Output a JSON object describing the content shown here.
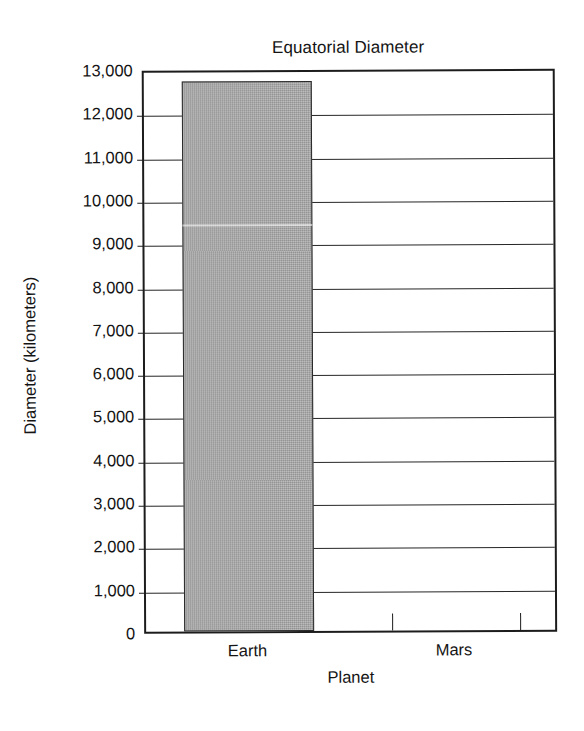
{
  "chart_data": {
    "type": "bar",
    "title": "Equatorial Diameter",
    "xlabel": "Planet",
    "ylabel": "Diameter (kilometers)",
    "categories": [
      "Earth",
      "Mars"
    ],
    "values": [
      12800,
      null
    ],
    "ylim": [
      0,
      13000
    ],
    "ytick_step": 1000,
    "yticks": [
      "13,000",
      "12,000",
      "11,000",
      "10,000",
      "9,000",
      "8,000",
      "7,000",
      "6,000",
      "5,000",
      "4,000",
      "3,000",
      "2,000",
      "1,000",
      "0"
    ],
    "ytick_values": [
      13000,
      12000,
      11000,
      10000,
      9000,
      8000,
      7000,
      6000,
      5000,
      4000,
      3000,
      2000,
      1000,
      0
    ],
    "grid": true,
    "legend": "none",
    "bar_color": "#a3a3a3",
    "line_color": "#1c1c1c"
  },
  "series": {
    "earth": {
      "label": "Earth",
      "value": 12800
    },
    "mars": {
      "label": "Mars",
      "value": null
    }
  }
}
